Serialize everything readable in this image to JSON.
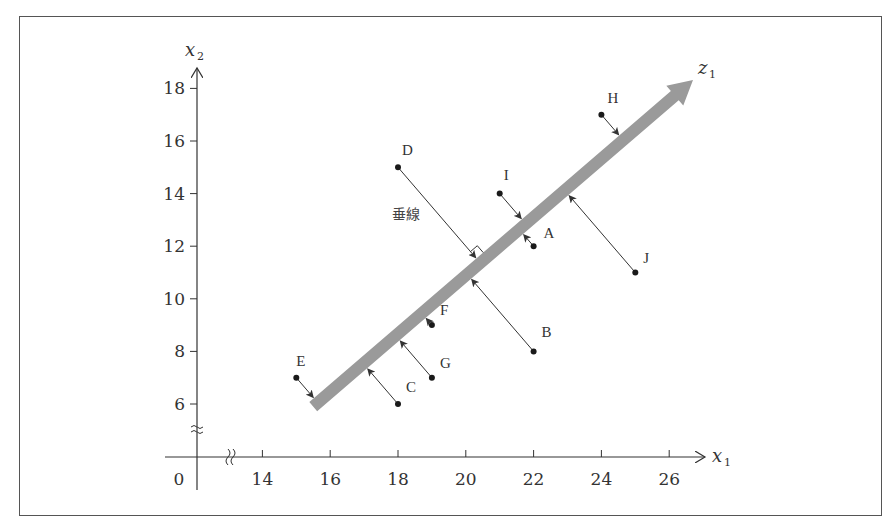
{
  "chart_data": {
    "type": "scatter",
    "title": "",
    "xlabel": "x1",
    "ylabel": "x2",
    "axis_break_x": true,
    "axis_break_y": true,
    "origin_label": "0",
    "x_ticks": [
      14,
      16,
      18,
      20,
      22,
      24,
      26
    ],
    "y_ticks": [
      6,
      8,
      10,
      12,
      14,
      16,
      18
    ],
    "points": [
      {
        "label": "A",
        "x": 22,
        "y": 12
      },
      {
        "label": "B",
        "x": 22,
        "y": 8
      },
      {
        "label": "C",
        "x": 18,
        "y": 6
      },
      {
        "label": "D",
        "x": 18,
        "y": 15
      },
      {
        "label": "E",
        "x": 15,
        "y": 7
      },
      {
        "label": "F",
        "x": 19,
        "y": 9
      },
      {
        "label": "G",
        "x": 19,
        "y": 7
      },
      {
        "label": "H",
        "x": 24,
        "y": 17
      },
      {
        "label": "I",
        "x": 21,
        "y": 14
      },
      {
        "label": "J",
        "x": 25,
        "y": 11
      }
    ],
    "principal_axis": {
      "label": "z1",
      "from": [
        15.5,
        5.9
      ],
      "to": [
        26.8,
        18.3
      ]
    },
    "annotation": "垂線",
    "grid": false
  },
  "labels": {
    "x_axis": "x",
    "x_axis_sub": "1",
    "y_axis": "x",
    "y_axis_sub": "2",
    "z_axis": "z",
    "z_axis_sub": "1",
    "perpendicular": "垂線",
    "origin": "0"
  },
  "colors": {
    "principal_axis": "#9a9a9a",
    "lines": "#333333",
    "points": "#1a1a1a"
  }
}
